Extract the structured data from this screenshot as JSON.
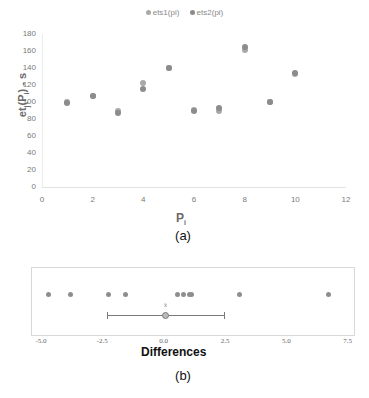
{
  "chart_data": [
    {
      "id": "a",
      "type": "scatter",
      "title": "",
      "legend": [
        "ets1(pi)",
        "ets2(pi)"
      ],
      "legend_position": "top",
      "xlabel": "Pi",
      "ylabel": "etj(Pi) - s",
      "xlim": [
        0,
        12
      ],
      "ylim": [
        0,
        180
      ],
      "x_ticks": [
        0,
        2,
        4,
        6,
        8,
        10,
        12
      ],
      "y_ticks": [
        0,
        20,
        40,
        60,
        80,
        100,
        120,
        140,
        160,
        180
      ],
      "grid": false,
      "x": [
        1,
        2,
        3,
        4,
        5,
        6,
        7,
        8,
        9,
        10
      ],
      "series": [
        {
          "name": "ets1(pi)",
          "color": "#a9a9a9",
          "values": [
            100,
            107,
            89,
            122,
            140,
            91,
            90,
            161,
            100,
            133
          ]
        },
        {
          "name": "ets2(pi)",
          "color": "#8c8c8c",
          "values": [
            99,
            107,
            87,
            115,
            140,
            90,
            93,
            165,
            100,
            134
          ]
        }
      ],
      "caption": "(a)"
    },
    {
      "id": "b",
      "type": "scatter",
      "title": "",
      "xlabel": "Differences",
      "xlim": [
        -5.0,
        7.5
      ],
      "x_ticks": [
        "-5.0",
        "-2.5",
        "0.0",
        "2.5",
        "5.0",
        "7.5"
      ],
      "values": [
        -4.7,
        -3.8,
        -2.25,
        -1.55,
        0.55,
        0.8,
        1.05,
        1.15,
        3.1,
        6.7
      ],
      "mean": 0.07,
      "ci": [
        -2.3,
        2.45
      ],
      "mean_marker_label": "x̄",
      "grid": false,
      "caption": "(b)"
    }
  ],
  "chart_a": {
    "legend": [
      {
        "label": "ets1(pi)",
        "color": "#a9a9a9"
      },
      {
        "label": "ets2(pi)",
        "color": "#8c8c8c"
      }
    ],
    "y_ticks": [
      "0",
      "20",
      "40",
      "60",
      "80",
      "100",
      "120",
      "140",
      "160",
      "180"
    ],
    "x_ticks": [
      "0",
      "2",
      "4",
      "6",
      "8",
      "10",
      "12"
    ],
    "ylabel": "etj(Pi) - s",
    "xlabel": "Pi",
    "caption": "(a)"
  },
  "chart_b": {
    "x_ticks": [
      "-5.0",
      "-2.5",
      "0.0",
      "2.5",
      "5.0",
      "7.5"
    ],
    "xlabel": "Differences",
    "caption": "(b)",
    "mean_marker": "x̄"
  }
}
